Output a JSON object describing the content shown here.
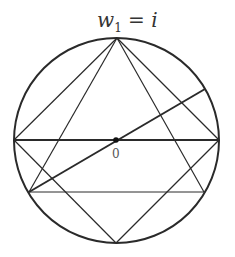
{
  "diagram": {
    "label_top": {
      "var": "w",
      "sub": "1",
      "rest": " = i"
    },
    "label_origin": "0",
    "circle": {
      "cx": 116.5,
      "cy": 140.5,
      "r": 102.5
    },
    "points": {
      "top": [
        117,
        38
      ],
      "left": [
        14,
        140
      ],
      "right": [
        219,
        140
      ],
      "bottom": [
        116,
        243
      ],
      "lower_left": [
        29,
        192
      ],
      "lower_right": [
        204,
        192
      ],
      "upper_right": [
        205,
        89
      ],
      "origin": [
        116,
        140
      ]
    },
    "colors": {
      "stroke": "#2a2a2a",
      "background": "#ffffff"
    }
  }
}
